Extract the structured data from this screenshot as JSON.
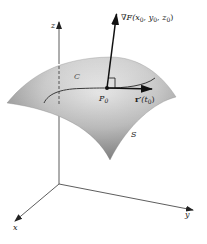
{
  "figure": {
    "type": "tangent-plane-gradient-diagram",
    "axes": {
      "x_label": "x",
      "y_label": "y",
      "z_label": "z"
    },
    "surface_label": "S",
    "curve_label": "C",
    "point": {
      "label": "P",
      "subscript": "0"
    },
    "gradient_vector": {
      "symbol": "∇F",
      "args_prefix": "(x",
      "args": [
        "0",
        "y",
        "0",
        "z",
        "0"
      ],
      "text": "∇F(x₀, y₀, z₀)"
    },
    "tangent_vector": {
      "symbol": "r′",
      "arg": "(t",
      "arg_sub": "0",
      "close": ")",
      "text": "r′(t₀)"
    },
    "right_angle_marker": true,
    "colors": {
      "surface_light": "#f2f2f2",
      "surface_dark": "#8f8f8f",
      "axis": "#333333",
      "vector": "#111111",
      "curve": "#3a3a3a"
    }
  }
}
